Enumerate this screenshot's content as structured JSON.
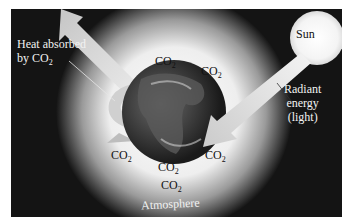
{
  "diagram": {
    "labels": {
      "sun": "Sun",
      "heat_absorbed_line1": "Heat absorbed",
      "heat_absorbed_line2": "by CO",
      "radiant_line1": "Radiant",
      "radiant_line2": "energy",
      "radiant_line3": "(light)",
      "atmosphere": "Atmosphere",
      "co2_base": "CO",
      "co2_sub": "2"
    },
    "co2_molecules": [
      {
        "base": "CO",
        "sub": "2"
      },
      {
        "base": "CO",
        "sub": "2"
      },
      {
        "base": "CO",
        "sub": "2"
      },
      {
        "base": "CO",
        "sub": "2"
      },
      {
        "base": "CO",
        "sub": "2"
      },
      {
        "base": "CO",
        "sub": "2"
      }
    ],
    "colors": {
      "background": "#141414",
      "atmosphere_glow": "#f4f4f4",
      "sun": "#f7f7f7",
      "earth_dark": "#2a2a2a",
      "arrow": "#d9d9d9",
      "page": "#ffffff"
    }
  }
}
